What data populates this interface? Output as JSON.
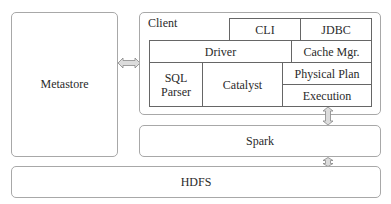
{
  "diagram": {
    "metastore": {
      "label": "Metastore"
    },
    "client": {
      "label": "Client",
      "components": {
        "cli": "CLI",
        "jdbc": "JDBC",
        "driver": "Driver",
        "cache_mgr": "Cache Mgr.",
        "sql_parser": "SQL Parser",
        "catalyst": "Catalyst",
        "physical_plan": "Physical Plan",
        "execution": "Execution"
      }
    },
    "spark": {
      "label": "Spark"
    },
    "hdfs": {
      "label": "HDFS"
    },
    "connections": [
      {
        "from": "Metastore",
        "to": "Client",
        "type": "bidirectional"
      },
      {
        "from": "Execution",
        "to": "Spark",
        "type": "bidirectional"
      },
      {
        "from": "Spark",
        "to": "HDFS",
        "type": "bidirectional"
      }
    ]
  }
}
